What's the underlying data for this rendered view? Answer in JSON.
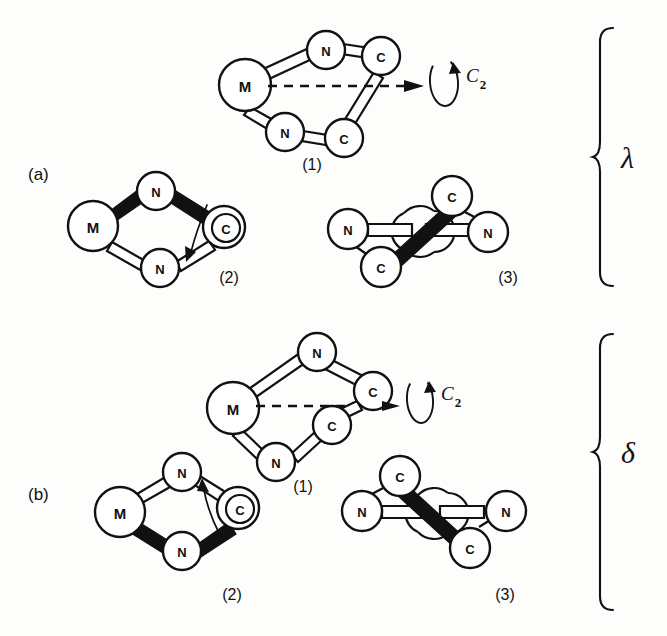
{
  "figure": {
    "background_color": "#fdfdfc",
    "ink_color": "#111111",
    "panels": [
      {
        "id": "a",
        "panel_label": "(a)",
        "conformer_label": "λ",
        "structures": [
          {
            "number_label": "(1)",
            "view": "perspective",
            "atoms": [
              {
                "symbol": "M",
                "x": 245,
                "y": 85,
                "r": 26
              },
              {
                "symbol": "N",
                "x": 326,
                "y": 50,
                "r": 19
              },
              {
                "symbol": "C",
                "x": 381,
                "y": 56,
                "r": 19
              },
              {
                "symbol": "N",
                "x": 285,
                "y": 132,
                "r": 19
              },
              {
                "symbol": "C",
                "x": 344,
                "y": 138,
                "r": 19
              }
            ],
            "axis": {
              "type": "c2-axis",
              "label": "C",
              "subscript": "2"
            }
          },
          {
            "number_label": "(2)",
            "view": "newman-side",
            "atoms": [
              {
                "symbol": "M",
                "x": 93,
                "y": 226,
                "r": 25
              },
              {
                "symbol": "N",
                "x": 156,
                "y": 191,
                "r": 19
              },
              {
                "symbol": "C",
                "x": 224,
                "y": 227,
                "r": 21
              },
              {
                "symbol": "N",
                "x": 160,
                "y": 268,
                "r": 19
              }
            ],
            "arrow_direction": "down"
          },
          {
            "number_label": "(3)",
            "view": "end-on",
            "atoms": [
              {
                "symbol": "N",
                "x": 348,
                "y": 229,
                "r": 20
              },
              {
                "symbol": "C",
                "x": 381,
                "y": 267,
                "r": 20
              },
              {
                "symbol": "C",
                "x": 452,
                "y": 196,
                "r": 20
              },
              {
                "symbol": "N",
                "x": 488,
                "y": 232,
                "r": 20
              }
            ]
          }
        ]
      },
      {
        "id": "b",
        "panel_label": "(b)",
        "conformer_label": "δ",
        "structures": [
          {
            "number_label": "(1)",
            "view": "perspective",
            "atoms": [
              {
                "symbol": "M",
                "x": 233,
                "y": 408,
                "r": 26
              },
              {
                "symbol": "N",
                "x": 317,
                "y": 352,
                "r": 19
              },
              {
                "symbol": "C",
                "x": 373,
                "y": 391,
                "r": 19
              },
              {
                "symbol": "N",
                "x": 276,
                "y": 462,
                "r": 19
              },
              {
                "symbol": "C",
                "x": 332,
                "y": 425,
                "r": 19
              }
            ],
            "axis": {
              "type": "c2-axis",
              "label": "C",
              "subscript": "2"
            }
          },
          {
            "number_label": "(2)",
            "view": "newman-side",
            "atoms": [
              {
                "symbol": "M",
                "x": 120,
                "y": 512,
                "r": 25
              },
              {
                "symbol": "N",
                "x": 182,
                "y": 472,
                "r": 19
              },
              {
                "symbol": "C",
                "x": 238,
                "y": 508,
                "r": 21
              },
              {
                "symbol": "N",
                "x": 182,
                "y": 551,
                "r": 19
              }
            ],
            "arrow_direction": "up"
          },
          {
            "number_label": "(3)",
            "view": "end-on",
            "atoms": [
              {
                "symbol": "C",
                "x": 400,
                "y": 476,
                "r": 20
              },
              {
                "symbol": "N",
                "x": 362,
                "y": 511,
                "r": 20
              },
              {
                "symbol": "C",
                "x": 470,
                "y": 548,
                "r": 20
              },
              {
                "symbol": "N",
                "x": 506,
                "y": 511,
                "r": 20
              }
            ]
          }
        ]
      }
    ],
    "symmetry_axis_label": "C",
    "symmetry_axis_subscript": "2",
    "atom_symbols": {
      "metal": "M",
      "nitrogen": "N",
      "carbon": "C"
    }
  }
}
